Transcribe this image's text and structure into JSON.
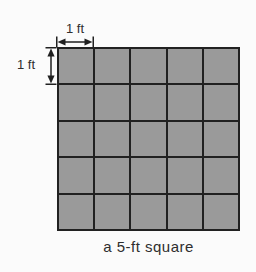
{
  "figure": {
    "caption": "a 5-ft square",
    "top_dimension_label": "1 ft",
    "left_dimension_label": "1 ft",
    "grid": {
      "rows": 5,
      "cols": 5
    },
    "colors": {
      "cell_fill": "#9a9a9a",
      "grid_line": "#212121",
      "background": "#fbfbfb",
      "text": "#2e2e2e"
    }
  }
}
